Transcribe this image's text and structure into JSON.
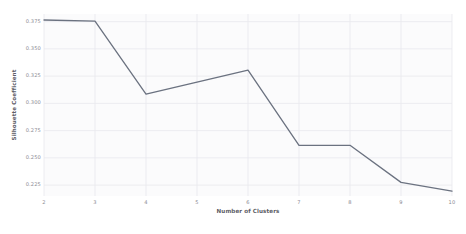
{
  "chart_data": {
    "type": "line",
    "title": "",
    "subtitle": "",
    "xlabel": "Number of Clusters",
    "ylabel": "Silhouette Coefficient",
    "x": [
      2,
      3,
      4,
      5,
      6,
      7,
      8,
      9,
      10
    ],
    "values": [
      0.3765,
      0.3755,
      0.3085,
      0.3195,
      0.3305,
      0.2615,
      0.2615,
      0.2275,
      0.2195
    ],
    "series": [
      {
        "name": "Silhouette Coefficient",
        "values": [
          0.3765,
          0.3755,
          0.3085,
          0.3195,
          0.3305,
          0.2615,
          0.2615,
          0.2275,
          0.2195
        ]
      }
    ],
    "xtick_labels": [
      "2",
      "3",
      "4",
      "5",
      "6",
      "7",
      "8",
      "9",
      "10"
    ],
    "ytick_labels": [
      "0.375",
      "0.350",
      "0.325",
      "0.300",
      "0.275",
      "0.250",
      "0.225"
    ],
    "ytick_values": [
      0.375,
      0.35,
      0.325,
      0.3,
      0.275,
      0.25,
      0.225
    ],
    "xlim": [
      2,
      10
    ],
    "ylim": [
      0.215,
      0.382
    ],
    "grid": true,
    "grid_axes": "both",
    "legend": false,
    "legend_position": "none",
    "markers": false,
    "annotations": [],
    "colors": {
      "line": "#6b7280",
      "grid": "#e8e8ee",
      "plot_background": "#fbfbfc",
      "figure_background": "#ffffff",
      "tick_text": "#8a8a92",
      "axis_label_text": "#5d5d66"
    },
    "line_width": 1.3
  }
}
